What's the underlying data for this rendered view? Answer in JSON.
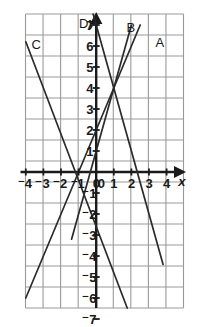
{
  "figure": {
    "kind": "coordinate-grid-line-graph",
    "background": "#ffffff",
    "line_color": "#2b2b2b",
    "grid_color": "#9a9a9a",
    "axis_color": "#1a1a1a"
  },
  "axes": {
    "x_name": "x",
    "y_name": "y",
    "x_ticks": [
      "⁻4",
      "⁻3",
      "⁻2",
      "⁻1",
      "0",
      "1",
      "2",
      "3",
      "4"
    ],
    "x_tick_values": [
      -4,
      -3,
      -2,
      -1,
      0,
      1,
      2,
      3,
      4
    ],
    "y_ticks": [
      "7",
      "6",
      "5",
      "4",
      "3",
      "2",
      "1",
      "⁻1",
      "⁻2",
      "⁻3",
      "⁻4",
      "⁻5",
      "⁻6",
      "⁻7"
    ],
    "y_tick_values": [
      7,
      6,
      5,
      4,
      3,
      2,
      1,
      -1,
      -2,
      -3,
      -4,
      -5,
      -6,
      -7
    ],
    "origin_label": "0",
    "xlim": [
      -4.55,
      4.55
    ],
    "ylim": [
      -7,
      7
    ],
    "grid": true
  },
  "chart_data": {
    "type": "line",
    "title": "",
    "xlabel": "x",
    "ylabel": "y",
    "xlim": [
      -4.55,
      4.55
    ],
    "ylim": [
      -7,
      7
    ],
    "grid": true,
    "legend": "inline-labels",
    "common_point": [
      1,
      4
    ],
    "series": [
      {
        "name": "A",
        "label": "A",
        "slope": 2,
        "intercept": 2,
        "points": [
          [
            -4,
            -6
          ],
          [
            1,
            4
          ],
          [
            4.5,
            11
          ]
        ],
        "drawn_from": [
          -4,
          -6
        ],
        "drawn_to": [
          2.5,
          7
        ],
        "label_pos": [
          3.6,
          6.2
        ]
      },
      {
        "name": "B",
        "label": "B",
        "slope": 3,
        "intercept": 1,
        "points": [
          [
            -1,
            -2
          ],
          [
            1,
            4
          ],
          [
            2,
            7
          ]
        ],
        "drawn_from": [
          -1.4,
          -3.2
        ],
        "drawn_to": [
          2,
          7
        ],
        "label_pos": [
          1.95,
          6.9
        ]
      },
      {
        "name": "C",
        "label": "C",
        "slope": -2.2,
        "intercept": -2.6,
        "points": [
          [
            -4,
            6.2
          ],
          [
            1,
            -4.8
          ],
          [
            2,
            -7
          ]
        ],
        "drawn_from": [
          -4,
          6.2
        ],
        "drawn_to": [
          2,
          -7
        ],
        "label_pos": [
          -3.45,
          6.1
        ]
      },
      {
        "name": "D",
        "label": "D",
        "slope": -3,
        "intercept": 7,
        "points": [
          [
            -0.2,
            7.6
          ],
          [
            0,
            7
          ],
          [
            1,
            4
          ],
          [
            4,
            -4
          ]
        ],
        "drawn_from": [
          -0.2,
          7.6
        ],
        "drawn_to": [
          3.8,
          -4.4
        ],
        "label_pos": [
          -0.75,
          7.1
        ]
      }
    ]
  },
  "labels": {
    "curve_a": "A",
    "curve_b": "B",
    "curve_c": "C",
    "curve_d": "D",
    "x_axis": "x",
    "y_axis": "y"
  }
}
